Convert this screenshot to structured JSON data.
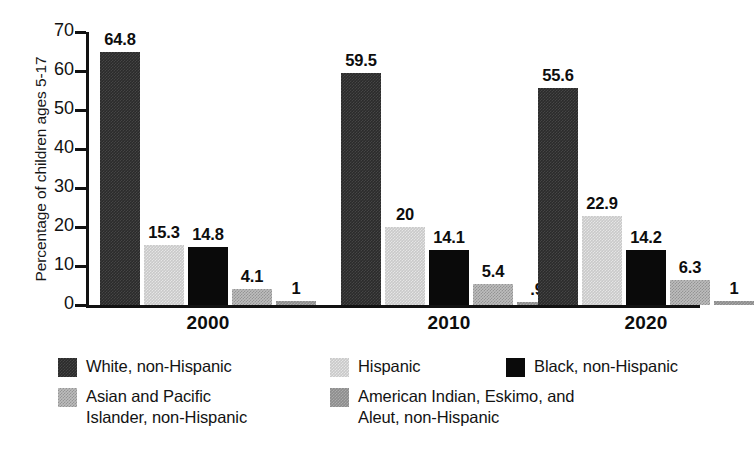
{
  "chart_data": {
    "type": "bar",
    "title": "",
    "xlabel": "",
    "ylabel": "Percentage of children ages 5-17",
    "ylim": [
      0,
      70
    ],
    "yticks": [
      0,
      10,
      20,
      30,
      40,
      50,
      60,
      70
    ],
    "ytick_labels": [
      "0",
      "10",
      "20",
      "30",
      "40",
      "50",
      "60",
      "70"
    ],
    "grid": false,
    "legend_position": "bottom",
    "categories": [
      "2000",
      "2010",
      "2020"
    ],
    "series": [
      {
        "name": "White, non-Hispanic",
        "color": "#2b2b2b",
        "values": [
          64.8,
          59.5,
          55.6
        ],
        "labels": [
          "64.8",
          "59.5",
          "55.6"
        ]
      },
      {
        "name": "Hispanic",
        "color": "#c9c9c9",
        "values": [
          15.3,
          20,
          22.9
        ],
        "labels": [
          "15.3",
          "20",
          "22.9"
        ]
      },
      {
        "name": "Black, non-Hispanic",
        "color": "#0a0a0a",
        "values": [
          14.8,
          14.1,
          14.2
        ],
        "labels": [
          "14.8",
          "14.1",
          "14.2"
        ]
      },
      {
        "name": "Asian and Pacific Islander, non-Hispanic",
        "color": "#bdbdbd",
        "values": [
          4.1,
          5.4,
          6.3
        ],
        "labels": [
          "4.1",
          "5.4",
          "6.3"
        ]
      },
      {
        "name": "American Indian, Eskimo, and Aleut, non-Hispanic",
        "color": "#8d8d8d",
        "values": [
          1,
          0.9,
          1
        ],
        "labels": [
          "1",
          ".9",
          "1"
        ]
      }
    ]
  },
  "axis": {
    "ylabel": "Percentage of children ages 5-17",
    "ticks": [
      "70",
      "60",
      "50",
      "40",
      "30",
      "20",
      "10",
      "0"
    ]
  },
  "groups": [
    {
      "year": "2000",
      "bars": [
        {
          "series": "White, non-Hispanic",
          "label": "64.8",
          "value": 64.8
        },
        {
          "series": "Hispanic",
          "label": "15.3",
          "value": 15.3
        },
        {
          "series": "Black, non-Hispanic",
          "label": "14.8",
          "value": 14.8
        },
        {
          "series": "Asian and Pacific Islander, non-Hispanic",
          "label": "4.1",
          "value": 4.1
        },
        {
          "series": "American Indian, Eskimo, and Aleut, non-Hispanic",
          "label": "1",
          "value": 1
        }
      ]
    },
    {
      "year": "2010",
      "bars": [
        {
          "series": "White, non-Hispanic",
          "label": "59.5",
          "value": 59.5
        },
        {
          "series": "Hispanic",
          "label": "20",
          "value": 20
        },
        {
          "series": "Black, non-Hispanic",
          "label": "14.1",
          "value": 14.1
        },
        {
          "series": "Asian and Pacific Islander, non-Hispanic",
          "label": "5.4",
          "value": 5.4
        },
        {
          "series": "American Indian, Eskimo, and Aleut, non-Hispanic",
          "label": ".9",
          "value": 0.9
        }
      ]
    },
    {
      "year": "2020",
      "bars": [
        {
          "series": "White, non-Hispanic",
          "label": "55.6",
          "value": 55.6
        },
        {
          "series": "Hispanic",
          "label": "22.9",
          "value": 22.9
        },
        {
          "series": "Black, non-Hispanic",
          "label": "14.2",
          "value": 14.2
        },
        {
          "series": "Asian and Pacific Islander, non-Hispanic",
          "label": "6.3",
          "value": 6.3
        },
        {
          "series": "American Indian, Eskimo, and Aleut, non-Hispanic",
          "label": "1",
          "value": 1
        }
      ]
    }
  ],
  "legend": {
    "row1": [
      {
        "label": "White, non-Hispanic",
        "color": "#2b2b2b"
      },
      {
        "label": "Hispanic",
        "color": "#c9c9c9"
      },
      {
        "label": "Black, non-Hispanic",
        "color": "#0a0a0a"
      }
    ],
    "row2": [
      {
        "label": "Asian and Pacific\nIslander, non-Hispanic",
        "color": "#bdbdbd"
      },
      {
        "label": "American Indian, Eskimo, and\nAleut, non-Hispanic",
        "color": "#8d8d8d"
      }
    ]
  }
}
